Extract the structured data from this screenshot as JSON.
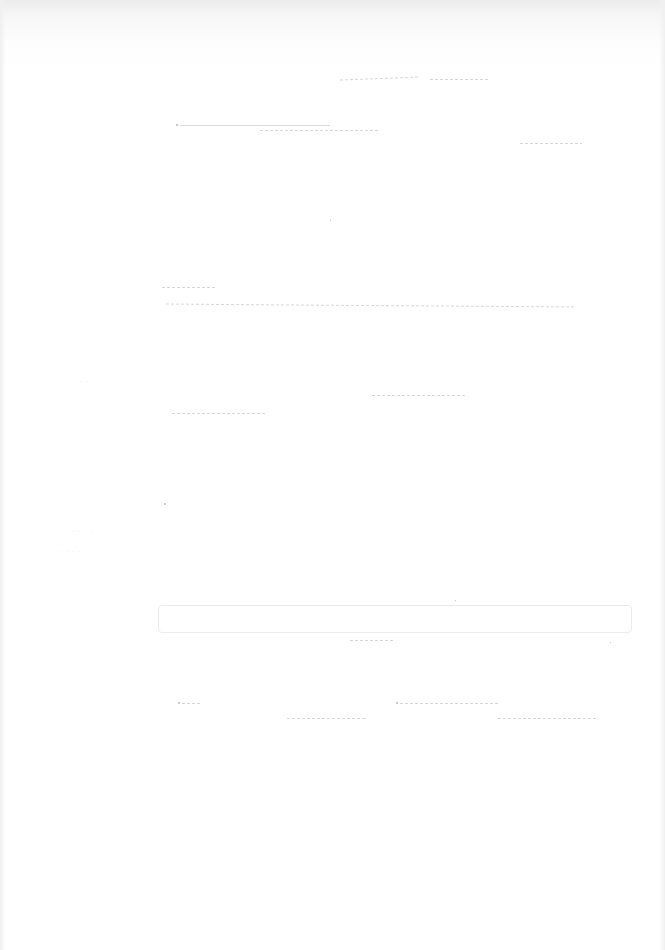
{
  "document": {
    "type": "scanned-page",
    "legible_text": [],
    "note": ""
  },
  "colors": {
    "paper": "#fefefe",
    "top_edge_shadow": "#ececec",
    "bleed_marks": "#c9c9c9"
  }
}
